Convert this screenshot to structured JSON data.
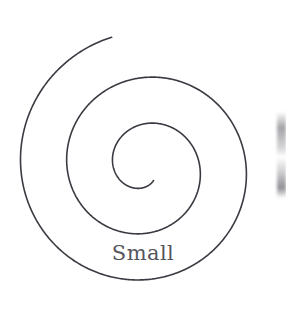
{
  "figure": {
    "kind": "spiral-diagram",
    "background_color": "#ffffff",
    "width": 286,
    "height": 328,
    "label": {
      "text": "Small",
      "color": "#55555c",
      "font_size_px": 21,
      "center_x": 133,
      "baseline_y": 264
    },
    "spiral": {
      "type": "archimedean",
      "stroke_color": "#3a3a42",
      "stroke_width_px": 1.6,
      "center_x": 145,
      "center_y": 167,
      "direction": "counterclockwise-outward",
      "turns": 2.55,
      "inner_radius_px": 16,
      "outer_radius_px": 134,
      "turn_spacing_px": 46,
      "crossings_horizontal_y": 165,
      "crossings_left_x": [
        11,
        58,
        119
      ],
      "crossings_right_x": [
        182,
        248
      ],
      "crossings_vertical_x": 142,
      "crossings_top_y": [
        21,
        72
      ],
      "crossings_bottom_y": [
        228,
        297
      ],
      "inner_terminus_x": 150,
      "inner_terminus_y": 182,
      "outer_terminus_x": 232,
      "outer_terminus_y": 275
    },
    "artifact": {
      "name": "right-edge-smudge",
      "description": "faint blurred vertical mark at right border",
      "x": 277,
      "y": 112,
      "width": 9,
      "height": 86
    }
  }
}
